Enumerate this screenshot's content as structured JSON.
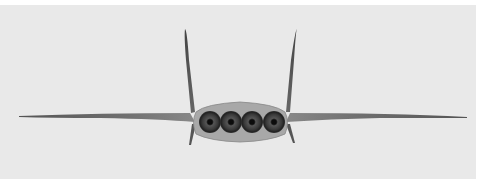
{
  "image": {
    "subject": "Rear view of aircraft model with four engine nozzles",
    "background_color": "#e9e9e9",
    "border_color": "#ffffff",
    "components": {
      "wings": 2,
      "vertical_tails": 2,
      "ventral_fins": 2,
      "engine_nozzles": 4
    }
  }
}
